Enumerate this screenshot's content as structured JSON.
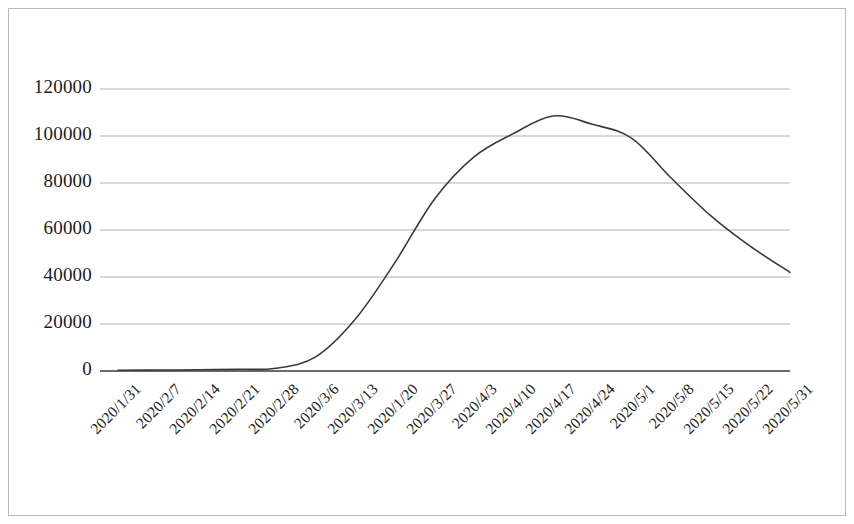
{
  "chart_data": {
    "type": "line",
    "title": "",
    "xlabel": "",
    "ylabel": "",
    "ylim": [
      0,
      120000
    ],
    "grid": true,
    "legend": false,
    "legend_position": "none",
    "line_color": "#3a3a3a",
    "grid_color": "#b0b0b0",
    "axis_color": "#3a3a3a",
    "categories": [
      "2020/1/31",
      "2020/2/7",
      "2020/2/14",
      "2020/2/21",
      "2020/2/28",
      "2020/3/6",
      "2020/3/13",
      "2020/1/20",
      "2020/3/27",
      "2020/4/3",
      "2020/4/10",
      "2020/4/17",
      "2020/4/24",
      "2020/5/1",
      "2020/5/8",
      "2020/5/15",
      "2020/5/22",
      "2020/5/31"
    ],
    "values": [
      300,
      400,
      500,
      700,
      1200,
      6000,
      22000,
      46000,
      73000,
      91000,
      101000,
      108500,
      105000,
      99000,
      82000,
      66000,
      53000,
      42000
    ],
    "yticks": [
      0,
      20000,
      40000,
      60000,
      80000,
      100000,
      120000
    ],
    "ytick_labels": [
      "0",
      "20000",
      "40000",
      "60000",
      "80000",
      "100000",
      "120000"
    ]
  }
}
